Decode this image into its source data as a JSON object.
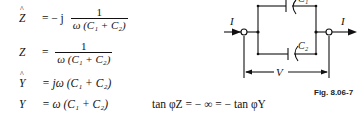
{
  "equations": {
    "z_hat": {
      "lhs": "Z",
      "sign": "= − j",
      "num": "1",
      "den": "ω (C₁ + C₂)"
    },
    "z": {
      "lhs": "Z",
      "sign": "=",
      "num": "1",
      "den": "ω (C₁ + C₂)"
    },
    "y_hat": {
      "lhs": "Y",
      "rhs": "= jω (C₁ + C₂)"
    },
    "y": {
      "lhs": "Y",
      "rhs": "= ω (C₁ + C₂)"
    },
    "tan_relation": "tan φZ = − ∞ = − tan φY"
  },
  "circuit": {
    "current_in_label": "I",
    "current_out_label": "I",
    "capacitor_top_label": "C₁",
    "capacitor_bottom_label": "C₂",
    "voltage_label": "V"
  },
  "figure_label": "Fig. 8.06-7"
}
